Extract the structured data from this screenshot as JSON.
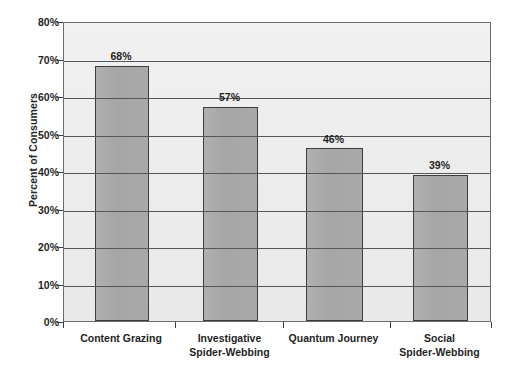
{
  "chart_data": {
    "type": "bar",
    "title": "",
    "subtitle": "",
    "xlabel": "",
    "ylabel": "Percent of Consumers",
    "categories": [
      "Content Grazing",
      "Investigative Spider-Webbing",
      "Quantum Journey",
      "Social Spider-Webbing"
    ],
    "category_lines": [
      [
        "Content Grazing",
        ""
      ],
      [
        "Investigative",
        "Spider-Webbing"
      ],
      [
        "Quantum Journey",
        ""
      ],
      [
        "Social",
        "Spider-Webbing"
      ]
    ],
    "values": [
      68,
      57,
      46,
      39
    ],
    "value_labels": [
      "68%",
      "57%",
      "46%",
      "39%"
    ],
    "ylim": [
      0,
      80
    ],
    "ytick_values": [
      0,
      10,
      20,
      30,
      40,
      50,
      60,
      70,
      80
    ],
    "ytick_labels": [
      "0%",
      "10%",
      "20%",
      "30%",
      "40%",
      "50%",
      "60%",
      "70%",
      "80%"
    ],
    "grid": "horizontal",
    "legend": "none",
    "colors": {
      "bar_fill": "#a9a9a9",
      "bar_border": "#3d3d3d",
      "plot_background": "#eeeeee",
      "gridline": "#55565a",
      "axis": "#3d3d3d",
      "text": "#1f1f1f",
      "page_background": "#ffffff"
    }
  }
}
